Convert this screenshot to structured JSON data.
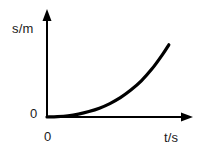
{
  "figure": {
    "background_color": "#ffffff",
    "ink_color": "#000000",
    "text_color": "#1a1a1a",
    "width": 202,
    "height": 153
  },
  "axes": {
    "y_axis": {
      "label": "s/m",
      "quantity": "s",
      "unit": "m",
      "name": "distance",
      "arrow": "up-arrow-icon",
      "origin_tick_label": "0"
    },
    "x_axis": {
      "label": "t/s",
      "quantity": "t",
      "unit": "s",
      "name": "time",
      "arrow": "right-arrow-icon",
      "origin_tick_label": "0"
    }
  },
  "chart_data": {
    "type": "line",
    "title": "",
    "subtitle": "",
    "xlabel": "t/s",
    "ylabel": "s/m",
    "grid": false,
    "legend": null,
    "axis_ticks": {
      "x": [
        "0"
      ],
      "y": [
        "0"
      ]
    },
    "xlim": [
      0,
      10
    ],
    "ylim": [
      0,
      10
    ],
    "annotations": [],
    "series": [
      {
        "name": "distance vs time",
        "shape": "increasing-convex",
        "description": "Curve starts at the origin with zero slope and steepens continuously, indicating accelerating motion.",
        "x": [
          0.0,
          0.8,
          1.6,
          2.4,
          3.2,
          4.0,
          4.8,
          5.6,
          6.4,
          7.2,
          8.0,
          8.8,
          9.3
        ],
        "y": [
          0.0,
          0.05,
          0.15,
          0.35,
          0.65,
          1.05,
          1.6,
          2.3,
          3.2,
          4.3,
          5.7,
          7.4,
          8.6
        ]
      }
    ]
  }
}
